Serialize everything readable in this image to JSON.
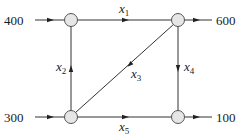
{
  "diagram": {
    "type": "network-flow",
    "colors": {
      "line": "#333333",
      "node_fill": "#e6e6e6",
      "node_stroke": "#555555",
      "text": "#1a1a1a"
    },
    "nodes": [
      {
        "id": "A",
        "position": "top-left"
      },
      {
        "id": "B",
        "position": "top-right"
      },
      {
        "id": "C",
        "position": "bottom-left"
      },
      {
        "id": "D",
        "position": "bottom-right"
      }
    ],
    "external_flows": {
      "in_top_left": {
        "value": "400",
        "direction": "in",
        "node": "A"
      },
      "out_top_right": {
        "value": "600",
        "direction": "out",
        "node": "B"
      },
      "in_bottom_left": {
        "value": "300",
        "direction": "in",
        "node": "C"
      },
      "out_bottom_right": {
        "value": "100",
        "direction": "out",
        "node": "D"
      }
    },
    "edges": {
      "x1": {
        "var": "x",
        "sub": "1",
        "from": "A",
        "to": "B"
      },
      "x2": {
        "var": "x",
        "sub": "2",
        "from": "C",
        "to": "A"
      },
      "x3": {
        "var": "x",
        "sub": "3",
        "from": "B",
        "to": "C"
      },
      "x4": {
        "var": "x",
        "sub": "4",
        "from": "B",
        "to": "D"
      },
      "x5": {
        "var": "x",
        "sub": "5",
        "from": "C",
        "to": "D"
      }
    }
  }
}
